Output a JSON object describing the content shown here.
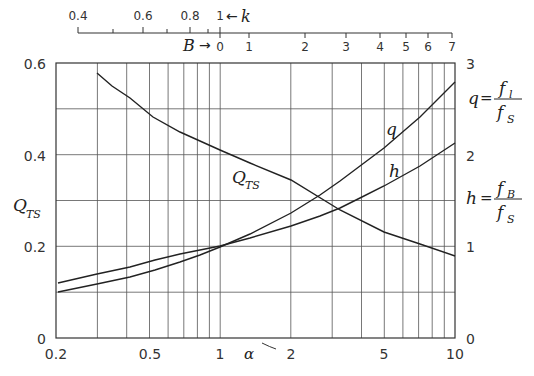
{
  "chart_data": {
    "type": "line",
    "title": "",
    "xlabel": "α",
    "xscale": "log",
    "xlim": [
      0.2,
      10
    ],
    "x_ticks": [
      "0.2",
      "0.5",
      "1",
      "2",
      "5",
      "10"
    ],
    "ylabel_left": "Q_TS",
    "ylim_left": [
      0,
      0.6
    ],
    "y_ticks_left": [
      "0",
      "0.2",
      "0.4",
      "0.6"
    ],
    "ylabel_right_top": "q = f_l / f_S",
    "ylabel_right_bottom": "h = f_B / f_S",
    "ylim_right": [
      0,
      3
    ],
    "y_ticks_right": [
      "0",
      "1",
      "2",
      "3"
    ],
    "top_axis_k": {
      "label": "k",
      "arrow": "←",
      "ticks": [
        "0.4",
        "0.6",
        "0.8",
        "1"
      ]
    },
    "top_axis_B": {
      "label": "B",
      "arrow": "→",
      "ticks": [
        "0",
        "1",
        "2",
        "3",
        "4",
        "5",
        "6",
        "7"
      ]
    },
    "grid": true,
    "series": [
      {
        "name": "Q_TS",
        "axis": "left",
        "x": [
          0.3,
          0.4,
          0.5,
          1,
          2,
          3,
          5,
          10
        ],
        "values": [
          0.58,
          0.53,
          0.48,
          0.41,
          0.34,
          0.28,
          0.23,
          0.18
        ]
      },
      {
        "name": "q",
        "axis": "right",
        "x": [
          0.2,
          0.3,
          0.4,
          0.6,
          1,
          2,
          3,
          5,
          7,
          10
        ],
        "values": [
          0.5,
          0.58,
          0.66,
          0.82,
          0.98,
          1.35,
          1.72,
          2.1,
          2.42,
          2.8
        ]
      },
      {
        "name": "h",
        "axis": "right",
        "x": [
          0.2,
          0.3,
          0.4,
          0.6,
          1,
          2,
          3,
          5,
          7,
          10
        ],
        "values": [
          0.6,
          0.7,
          0.78,
          0.91,
          1.0,
          1.22,
          1.42,
          1.66,
          1.88,
          2.14
        ]
      }
    ],
    "annotations": [
      "Q_TS",
      "q",
      "h"
    ]
  },
  "labels": {
    "k": "k",
    "k_arrow": "←",
    "B": "B",
    "B_arrow": "→",
    "alpha": "α",
    "Q": "Q",
    "Q_sub": "TS",
    "q": "q",
    "h": "h",
    "eq": "=",
    "f": "f",
    "sub_l": "l",
    "sub_S": "S",
    "sub_B": "B"
  },
  "ticks": {
    "k": [
      {
        "t": "0.4",
        "x": 78
      },
      {
        "t": "0.6",
        "x": 143
      },
      {
        "t": "0.8",
        "x": 190
      },
      {
        "t": "1",
        "x": 220
      }
    ],
    "k_minor": [
      113,
      167,
      208
    ],
    "B": [
      {
        "t": "0",
        "x": 227
      },
      {
        "t": "1",
        "x": 256
      },
      {
        "t": "2",
        "x": 306
      },
      {
        "t": "3",
        "x": 347
      },
      {
        "t": "4",
        "x": 381
      },
      {
        "t": "5",
        "x": 410
      },
      {
        "t": "6",
        "x": 432
      },
      {
        "t": "7",
        "x": 452
      }
    ],
    "B_tick_x": [
      220,
      249,
      305,
      346,
      380,
      406,
      428,
      452
    ],
    "x_bottom": [
      {
        "t": "0.2",
        "x": 56
      },
      {
        "t": "0.5",
        "x": 150
      },
      {
        "t": "1",
        "x": 220
      },
      {
        "t": "2",
        "x": 291
      },
      {
        "t": "5",
        "x": 384
      },
      {
        "t": "10",
        "x": 455
      }
    ],
    "y_left": [
      {
        "t": "0",
        "y": 338
      },
      {
        "t": "0.2",
        "y": 246
      },
      {
        "t": "0.4",
        "y": 155
      },
      {
        "t": "0.6",
        "y": 63
      }
    ],
    "y_right": [
      {
        "t": "0",
        "y": 338
      },
      {
        "t": "1",
        "y": 246
      },
      {
        "t": "2",
        "y": 155
      },
      {
        "t": "3",
        "y": 63
      }
    ]
  }
}
